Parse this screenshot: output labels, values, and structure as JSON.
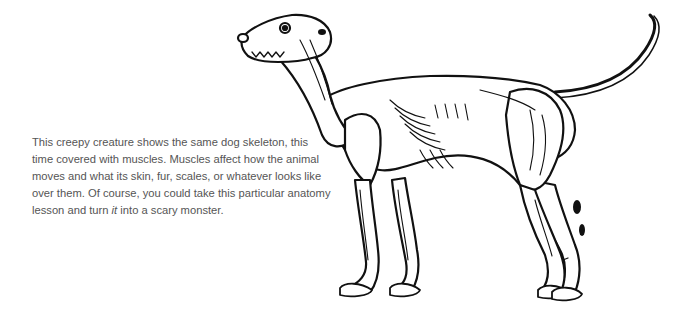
{
  "caption": {
    "before_italic": "This creepy creature shows the same dog skeleton, this time covered with muscles. Muscles affect how the animal moves and what its skin, fur, scales, or whatever looks like over them. Of course, you could take this particular anatomy lesson and turn ",
    "italic": "it",
    "after_italic": " into a scary monster."
  },
  "illustration": {
    "subject": "dog muscle anatomy ink drawing",
    "ink_color": "#111111",
    "fill_color": "#ffffff"
  }
}
